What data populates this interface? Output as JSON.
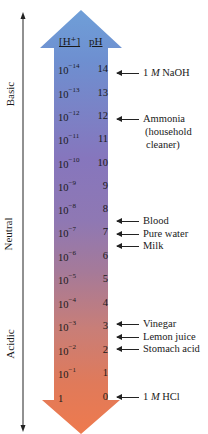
{
  "figure": {
    "column_headers": {
      "h_ion": "[H⁺]",
      "ph": "pH"
    },
    "axis": {
      "labels": {
        "basic": "Basic",
        "neutral": "Neutral",
        "acidic": "Acidic"
      }
    },
    "colors": {
      "top_arrow": "#6f9fd8",
      "mid": "#8a78b8",
      "bottom_arrow": "#ea7a50",
      "text": "#1a1a1a"
    },
    "rows": [
      {
        "h_base": "10",
        "h_exp": "−14",
        "ph": "14"
      },
      {
        "h_base": "10",
        "h_exp": "−13",
        "ph": "13"
      },
      {
        "h_base": "10",
        "h_exp": "−12",
        "ph": "12"
      },
      {
        "h_base": "10",
        "h_exp": "−11",
        "ph": "11"
      },
      {
        "h_base": "10",
        "h_exp": "−10",
        "ph": "10"
      },
      {
        "h_base": "10",
        "h_exp": "−9",
        "ph": "9"
      },
      {
        "h_base": "10",
        "h_exp": "−8",
        "ph": "8"
      },
      {
        "h_base": "10",
        "h_exp": "−7",
        "ph": "7"
      },
      {
        "h_base": "10",
        "h_exp": "−6",
        "ph": "6"
      },
      {
        "h_base": "10",
        "h_exp": "−5",
        "ph": "5"
      },
      {
        "h_base": "10",
        "h_exp": "−4",
        "ph": "4"
      },
      {
        "h_base": "10",
        "h_exp": "−3",
        "ph": "3"
      },
      {
        "h_base": "10",
        "h_exp": "−2",
        "ph": "2"
      },
      {
        "h_base": "10",
        "h_exp": "−1",
        "ph": "1"
      },
      {
        "h_base": "1",
        "h_exp": "",
        "ph": "0"
      }
    ],
    "examples": [
      {
        "label_pre": "1 ",
        "label_em": "M",
        "label_post": " NaOH",
        "ph": 14
      },
      {
        "label": "Ammonia",
        "line2": "(household",
        "line3": "cleaner)",
        "ph": 12
      },
      {
        "label": "Blood",
        "ph": 7.4
      },
      {
        "label": "Pure water",
        "ph": 7
      },
      {
        "label": "Milk",
        "ph": 6.5
      },
      {
        "label": "Vinegar",
        "ph": 2.9
      },
      {
        "label": "Lemon juice",
        "ph": 2.4
      },
      {
        "label": "Stomach acid",
        "ph": 2
      },
      {
        "label_pre": "1 ",
        "label_em": "M",
        "label_post": " HCl",
        "ph": 0
      }
    ]
  }
}
